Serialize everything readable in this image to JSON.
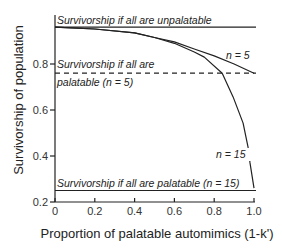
{
  "chart_data": {
    "type": "line",
    "title": "",
    "xlabel": "Proportion of palatable automimics (1-k')",
    "ylabel": "Survivorship of population",
    "xlim": [
      0,
      1.0
    ],
    "ylim": [
      0.2,
      1.0
    ],
    "grid": false,
    "legend": "none",
    "x_ticks": [
      "0",
      "0.2",
      "0.4",
      "0.6",
      "0.8",
      "1.0"
    ],
    "y_ticks": [
      "0.2",
      "0.4",
      "0.6",
      "0.8"
    ],
    "reference_lines": [
      {
        "name": "Survivorship if all are unpalatable",
        "y": 0.96,
        "style": "solid"
      },
      {
        "name": "Survivorship if all are palatable (n = 5)",
        "y": 0.76,
        "style": "dashed"
      },
      {
        "name": "Survivorship if all are palatable (n = 15)",
        "y": 0.25,
        "style": "solid"
      }
    ],
    "series": [
      {
        "name": "n = 5",
        "x": [
          0,
          0.2,
          0.4,
          0.5,
          0.6,
          0.7,
          0.8,
          0.9,
          1.0
        ],
        "y": [
          0.96,
          0.952,
          0.935,
          0.915,
          0.896,
          0.865,
          0.835,
          0.8,
          0.76
        ]
      },
      {
        "name": "n = 15",
        "x": [
          0,
          0.2,
          0.4,
          0.5,
          0.6,
          0.7,
          0.75,
          0.84,
          0.895,
          0.945,
          0.97,
          0.98,
          1.0
        ],
        "y": [
          0.96,
          0.952,
          0.935,
          0.915,
          0.89,
          0.852,
          0.83,
          0.76,
          0.657,
          0.543,
          0.44,
          0.37,
          0.26
        ]
      }
    ],
    "annotations": [
      {
        "text": "Survivorship if all are unpalatable"
      },
      {
        "text": "Survivorship if all are"
      },
      {
        "text": "palatable (n = 5)"
      },
      {
        "text": "Survivorship if all are palatable (n = 15)"
      },
      {
        "text": "n = 5"
      },
      {
        "text": "n = 15"
      }
    ]
  },
  "labels": {
    "top_line": "Survivorship if all are unpalatable",
    "dashed_line_1": "Survivorship if all are",
    "dashed_line_2": "palatable (n = 5)",
    "bottom_line": "Survivorship if all are palatable (n = 15)",
    "n5": "n = 5",
    "n15": "n = 15"
  }
}
